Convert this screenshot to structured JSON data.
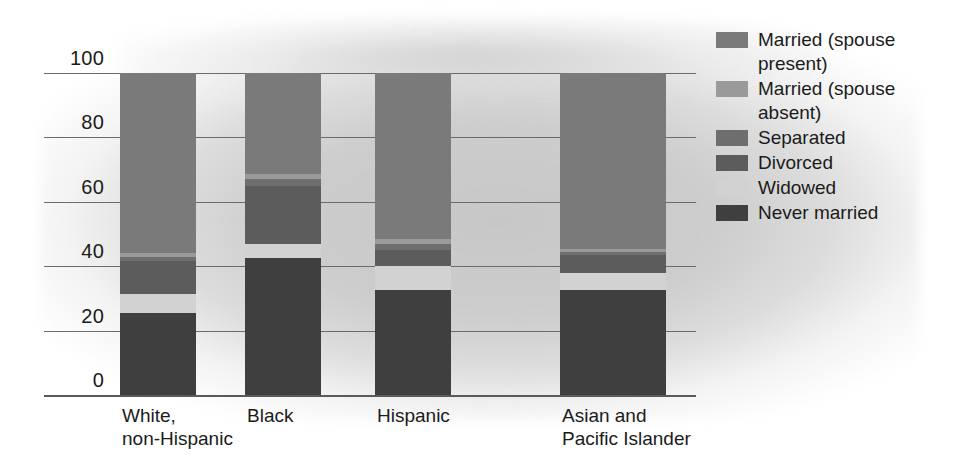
{
  "chart_data": {
    "type": "bar",
    "subtype": "stacked-bar-100",
    "title": "",
    "subtitle": "",
    "xlabel": "",
    "ylabel": "",
    "ylim": [
      0,
      100
    ],
    "yticks": [
      "0",
      "20",
      "40",
      "60",
      "80",
      "100"
    ],
    "grid": true,
    "legend_position": "right",
    "categories": [
      "White,\nnon-Hispanic",
      "Black",
      "Hispanic",
      "Asian and\nPacific Islander"
    ],
    "series": [
      {
        "name": "Never married",
        "color": "#3f3f3f",
        "values": [
          25.5,
          42.5,
          32.5,
          32.5
        ]
      },
      {
        "name": "Widowed",
        "color": "#d2d2d2",
        "values": [
          6.0,
          4.5,
          7.5,
          5.5
        ]
      },
      {
        "name": "Divorced",
        "color": "#5c5c5c",
        "values": [
          10.0,
          18.0,
          5.0,
          5.5
        ]
      },
      {
        "name": "Separated",
        "color": "#6e6e6e",
        "values": [
          1.5,
          2.0,
          2.0,
          1.0
        ]
      },
      {
        "name": "Married (spouse absent)",
        "color": "#9a9a9a",
        "values": [
          1.0,
          1.5,
          1.5,
          1.0
        ]
      },
      {
        "name": "Married (spouse present)",
        "color": "#7a7a7a",
        "values": [
          56.0,
          31.5,
          51.5,
          54.5
        ]
      }
    ]
  },
  "legend": {
    "items": [
      {
        "label": "Married (spouse\npresent)",
        "color": "#7a7a7a"
      },
      {
        "label": "Married (spouse\nabsent)",
        "color": "#9a9a9a"
      },
      {
        "label": "Separated",
        "color": "#6e6e6e"
      },
      {
        "label": "Divorced",
        "color": "#5c5c5c"
      },
      {
        "label": "Widowed",
        "color": "#d2d2d2"
      },
      {
        "label": "Never married",
        "color": "#3f3f3f"
      }
    ]
  },
  "axis": {
    "yticks": [
      "100",
      "80",
      "60",
      "40",
      "20",
      "0"
    ]
  },
  "xaxis": {
    "labels": [
      "White,\nnon-Hispanic",
      "Black",
      "Hispanic",
      "Asian and\nPacific Islander"
    ]
  },
  "colors": {
    "background": "#ffffff",
    "wash": "#cccccc",
    "gridline": "#6b6b6b",
    "text": "#1b1b1b"
  }
}
